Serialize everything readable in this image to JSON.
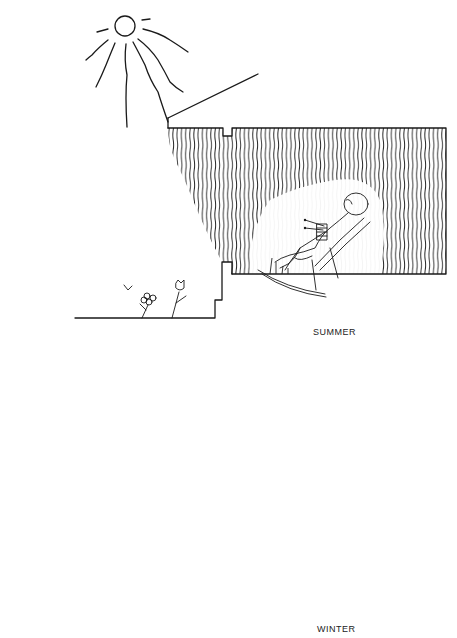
{
  "panels": [
    {
      "id": "summer",
      "caption": "SUMMER",
      "description": "High summer sun; roof overhang shades window so sunlight does not reach interior"
    },
    {
      "id": "winter",
      "caption": "WINTER",
      "description": "Low winter sun; sunlight enters under overhang and warms person in rocking chair"
    }
  ],
  "colors": {
    "ink": "#1a1a1a",
    "background": "#ffffff"
  }
}
